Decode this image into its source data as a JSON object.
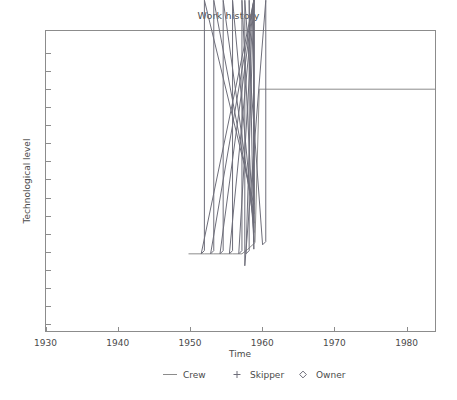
{
  "chart_data": {
    "type": "line",
    "title": "Work history",
    "xlabel": "Time",
    "ylabel": "Technological level",
    "xlim": [
      1930,
      1984
    ],
    "ylim": [
      0,
      10
    ],
    "xticks": [
      1930,
      1940,
      1950,
      1960,
      1970,
      1980
    ],
    "xtick_labels": [
      "1930",
      "1940",
      "1950",
      "1960",
      "1970",
      "1980"
    ],
    "yticks": [
      0.25,
      0.85,
      1.45,
      2.05,
      2.65,
      3.25,
      3.85,
      4.45,
      5.05,
      5.65,
      6.25,
      6.85,
      7.45,
      8.05,
      8.65,
      9.25
    ],
    "ytick_labels": [
      "",
      "",
      "",
      "",
      "",
      "",
      "",
      "",
      "",
      "",
      "",
      "",
      "",
      "",
      "",
      ""
    ],
    "grid": false,
    "legend_position": "bottom",
    "series": [
      {
        "name": "Crew",
        "marker": "line",
        "x": [
          1949.8,
          1952.0,
          1953.3,
          1954.6,
          1955.9,
          1957.2,
          1958.0,
          1959.0,
          1959.6,
          1984.0
        ],
        "y": [
          2.58,
          2.58,
          2.58,
          2.58,
          2.58,
          2.58,
          2.73,
          2.95,
          8.05,
          8.05
        ]
      },
      {
        "name": "Skipper",
        "marker": "+",
        "x": [],
        "y": []
      },
      {
        "name": "Owner",
        "marker": "diamond",
        "x": [
          1952.0,
          1953.3,
          1954.6,
          1955.9,
          1957.2,
          1958.2,
          1960.5
        ],
        "y": [
          2.58,
          2.58,
          2.58,
          2.58,
          2.58,
          2.58,
          2.88
        ]
      }
    ],
    "legend": [
      {
        "label": "Crew",
        "marker": "line"
      },
      {
        "label": "Skipper",
        "marker": "plus"
      },
      {
        "label": "Owner",
        "marker": "diamond"
      }
    ],
    "colors": {
      "axis": "#8c8c8c",
      "text": "#4a4a4a",
      "line": "#8c8c8c",
      "marker": "#6e6e7a",
      "background": "#ffffff"
    }
  }
}
